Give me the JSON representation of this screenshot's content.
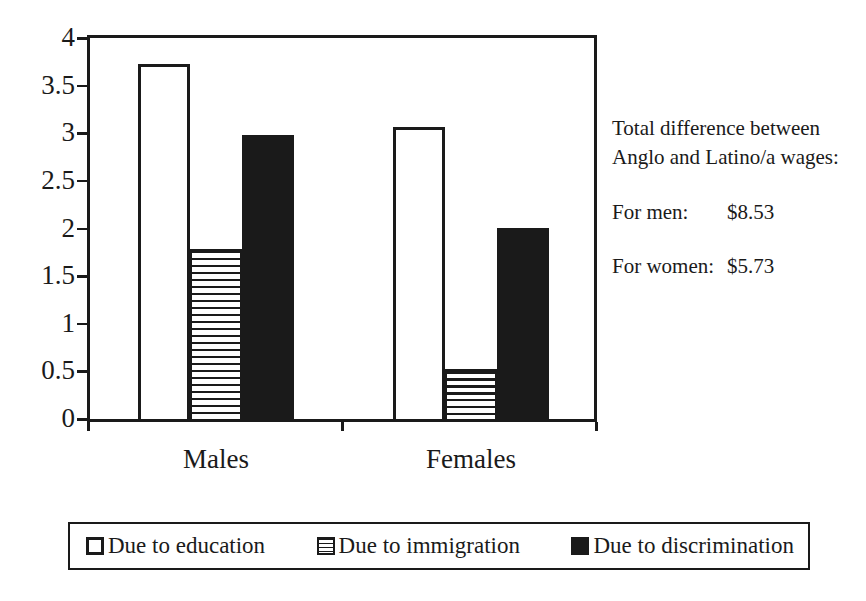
{
  "chart_data": {
    "type": "bar",
    "title": "",
    "xlabel": "",
    "ylabel": "",
    "categories": [
      "Males",
      "Females"
    ],
    "series": [
      {
        "name": "Due to education",
        "pattern": "white",
        "values": [
          3.73,
          3.07
        ]
      },
      {
        "name": "Due to immigration",
        "pattern": "hstripes",
        "values": [
          1.78,
          0.53
        ]
      },
      {
        "name": "Due to discrimination",
        "pattern": "black",
        "values": [
          2.98,
          2.0
        ]
      }
    ],
    "ylim": [
      0,
      4
    ],
    "ytick_step": 0.5,
    "ytick_labels": [
      "0",
      "0.5",
      "1",
      "1.5",
      "2",
      "2.5",
      "3",
      "3.5",
      "4"
    ],
    "grid": false,
    "legend_position": "bottom"
  },
  "side_note": {
    "line1": "Total difference between",
    "line2": "Anglo and Latino/a wages:",
    "men_label": "For men:",
    "men_value": "$8.53",
    "women_label": "For women:",
    "women_value": "$5.73"
  },
  "colors": {
    "ink": "#1a1a1a",
    "paper": "#ffffff"
  }
}
